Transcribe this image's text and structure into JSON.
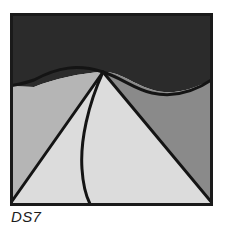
{
  "figure": {
    "caption": "DS7",
    "panel": {
      "x": 10,
      "y": 13,
      "width": 203,
      "height": 193,
      "border_color": "#1a1a1a",
      "border_width": 2
    },
    "palette": {
      "sky_dark": "#2b2b2b",
      "left_mid_gray": "#b5b5b5",
      "center_light_gray": "#dcdcdc",
      "right_dark_gray": "#8a8a8a",
      "outline": "#141414",
      "background": "#ffffff",
      "caption_color": "#1c1c1c"
    },
    "regions": [
      {
        "name": "sky",
        "label": "dark upper region",
        "fill": "#2b2b2b",
        "description": "Dark band across the top bounded below by a wavy S-curve"
      },
      {
        "name": "left-slope",
        "label": "left medium gray region",
        "fill": "#b5b5b5",
        "description": "Left region under the wave, bounded right by a straight diagonal from the apex to the lower-left corner"
      },
      {
        "name": "center-cone",
        "label": "center light gray region",
        "fill": "#dcdcdc",
        "description": "Bright wedge from the apex widening toward the lower right, left edge curved"
      },
      {
        "name": "right-slope",
        "label": "right dark gray region",
        "fill": "#8a8a8a",
        "description": "Right region under the wave, bounded left by a straight diagonal from the apex to the bottom-right corner"
      }
    ],
    "edges": [
      {
        "name": "wave-curve",
        "type": "curve",
        "description": "S-shaped curve from the left edge, cresting near the apex, dipping right of center, rising to the right edge"
      },
      {
        "name": "left-diagonal",
        "type": "line",
        "description": "Straight line from apex to the bottom-left corner"
      },
      {
        "name": "right-diagonal",
        "type": "line",
        "description": "Straight line from apex to the bottom-right corner"
      },
      {
        "name": "inner-curve",
        "type": "curve",
        "description": "Curve from apex bowing left then sweeping down to the bottom edge"
      }
    ]
  }
}
